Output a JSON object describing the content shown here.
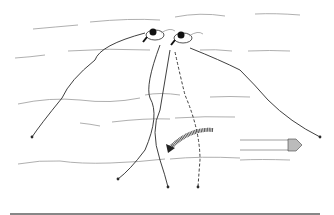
{
  "illustration": {
    "width": 334,
    "height": 215,
    "background": "#ffffff",
    "ink_color": "#2a2a2a",
    "water_color": "#9a9a9a",
    "water_lines": [
      "M33,29 Q55,27 78,25",
      "M90,22 Q130,18 160,20",
      "M175,17 Q200,12 225,16",
      "M255,14 Q275,13 300,15",
      "M15,58 Q30,57 45,55",
      "M68,51 Q110,48 150,50",
      "M200,50 Q215,49 232,51",
      "M248,51 Q270,50 290,51",
      "M18,104 Q50,97 80,100 Q110,104 140,98",
      "M145,95 Q160,92 180,95",
      "M210,97 Q230,96 250,97",
      "M80,123 Q90,124 100,126",
      "M112,122 Q145,118 170,119",
      "M175,118 Q205,116 235,117",
      "M18,164 Q40,160 60,161 Q80,164 110,163 Q140,162 165,159",
      "M170,159 Q200,156 240,158",
      "M240,160 Q260,159 290,160"
    ],
    "lines": [
      {
        "name": "line-left",
        "d": "M145,33 Q100,45 95,60 Q70,80 62,98 Q40,125 32,137",
        "dashed": false,
        "end": [
          32,
          137
        ]
      },
      {
        "name": "line-center-left",
        "d": "M160,45 Q145,85 150,98 Q160,115 145,150 Q130,170 118,179",
        "dashed": false,
        "end": [
          118,
          179
        ]
      },
      {
        "name": "line-center",
        "d": "M170,50 Q165,80 160,110 Q150,130 160,160 Q165,175 168,187",
        "dashed": false,
        "end": [
          168,
          187
        ]
      },
      {
        "name": "line-dashed",
        "d": "M175,52 Q180,75 185,95 Q200,130 200,160 Q199,172 198,187",
        "dashed": true,
        "end": [
          198,
          187
        ]
      },
      {
        "name": "line-right",
        "d": "M190,48 Q220,60 240,70 Q255,85 268,100 Q290,122 320,137",
        "dashed": false,
        "end": [
          320,
          137
        ]
      }
    ],
    "swimmers": [
      {
        "name": "swimmer-left",
        "cx": 155,
        "cy": 35
      },
      {
        "name": "swimmer-right",
        "cx": 183,
        "cy": 38
      }
    ],
    "curved_arrow": {
      "d": "M213,130 Q190,128 170,148",
      "color": "#555555"
    },
    "straight_arrow": {
      "x1": 240,
      "x2": 300,
      "y1": 140,
      "y2": 150,
      "tip_x": 300,
      "color": "#444444"
    },
    "bottom_rule": {
      "x1": 10,
      "x2": 320,
      "y": 214,
      "color": "#111111"
    }
  }
}
